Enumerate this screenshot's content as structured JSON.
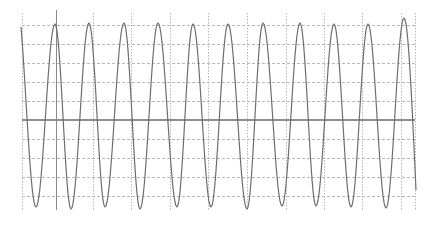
{
  "chart_data": {
    "type": "line",
    "title": "",
    "xlabel": "",
    "ylabel": "",
    "grid": true,
    "legend": null,
    "plot_area_px": {
      "left": 22,
      "right": 415,
      "top": 13,
      "bottom": 210
    },
    "zero_line_y_px": 120,
    "cursor_x_px": 56,
    "vertical_grid_x_px": [
      22,
      56,
      93,
      131,
      170,
      208,
      247,
      286,
      324,
      362,
      401,
      415
    ],
    "horizontal_grid_y_px": [
      25,
      44,
      63,
      82,
      101,
      139,
      158,
      177,
      196
    ],
    "ylim": [
      -5,
      5
    ],
    "y_divisions": 10,
    "peaks_x_px": [
      55,
      89,
      124,
      158,
      193,
      228,
      263,
      300,
      334,
      368,
      404
    ],
    "peaks_y_px": [
      24,
      23,
      23,
      23,
      24,
      24,
      23,
      23,
      24,
      24,
      18
    ],
    "troughs_x_px": [
      36,
      71,
      105,
      140,
      177,
      211,
      247,
      282,
      316,
      351,
      386
    ],
    "troughs_y_px": [
      207,
      209,
      207,
      209,
      207,
      207,
      209,
      206,
      206,
      207,
      208
    ],
    "start_point_px": [
      21,
      27
    ],
    "end_point_px": [
      416,
      190
    ],
    "period_px": 34.9,
    "cycles_visible": 11.3,
    "series": [
      {
        "name": "signal",
        "amplitude_divisions": 4.6,
        "offset": 0
      }
    ]
  },
  "colors": {
    "background": "#ffffff",
    "signal": "#6e6e6e",
    "zero_line": "#6a6a6a",
    "cursor": "#8a8a8a",
    "grid": "#b8b8b8"
  }
}
